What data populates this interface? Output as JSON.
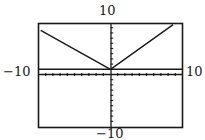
{
  "window": {
    "xmin_label": "−10",
    "xmax_label": "10",
    "ymin_label": "−10",
    "ymax_label": "10"
  },
  "colors": {
    "ink": "#1a1a1a",
    "background": "#ffffff"
  },
  "chart_data": {
    "type": "line",
    "title": "",
    "xlabel": "",
    "ylabel": "",
    "xlim": [
      -10,
      10
    ],
    "ylim": [
      -10,
      10
    ],
    "grid": false,
    "axes": {
      "x_ticks_every": 1,
      "y_ticks_every": 1
    },
    "tick_labels": {
      "left": "−10",
      "right": "10",
      "top": "10",
      "bottom": "−10"
    },
    "series": [
      {
        "name": "V-shaped graph (absolute value)",
        "style": "solid",
        "x": [
          -9.7,
          0,
          8.7
        ],
        "y": [
          8.5,
          1,
          9.6
        ]
      },
      {
        "name": "horizontal line",
        "style": "solid",
        "x": [
          -10,
          10
        ],
        "y": [
          1,
          1
        ]
      }
    ],
    "legend": null
  }
}
